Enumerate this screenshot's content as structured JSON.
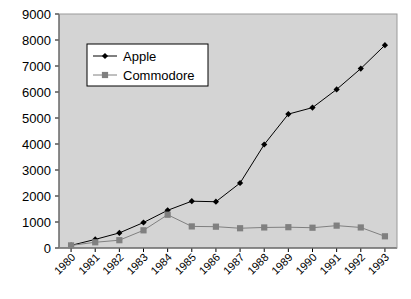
{
  "chart_data": {
    "type": "line",
    "title": "",
    "subtitle": "",
    "xlabel": "",
    "ylabel": "",
    "categories": [
      "1980",
      "1981",
      "1982",
      "1983",
      "1984",
      "1985",
      "1986",
      "1987",
      "1988",
      "1989",
      "1990",
      "1991",
      "1992",
      "1993"
    ],
    "series": [
      {
        "name": "Apple",
        "marker": "diamond",
        "color": "#000000",
        "values": [
          100,
          330,
          580,
          980,
          1450,
          1800,
          1780,
          2500,
          3980,
          5150,
          5400,
          6100,
          6900,
          7800
        ]
      },
      {
        "name": "Commodore",
        "marker": "square",
        "color": "#808080",
        "values": [
          100,
          220,
          300,
          680,
          1280,
          830,
          820,
          760,
          790,
          800,
          780,
          860,
          790,
          450
        ]
      }
    ],
    "ylim": [
      0,
      9000
    ],
    "yticks": [
      0,
      1000,
      2000,
      3000,
      4000,
      5000,
      6000,
      7000,
      8000,
      9000
    ],
    "ytick_labels": [
      "0",
      "1000",
      "2000",
      "3000",
      "4000",
      "5000",
      "6000",
      "7000",
      "8000",
      "9000"
    ],
    "grid": false,
    "legend_position": "top-left-inside",
    "plot_background": "#d4d4d4",
    "figure_background": "#ffffff",
    "legend_background": "#ffffff",
    "axis_color": "#000000"
  },
  "legend": {
    "entries": [
      {
        "label": "Apple"
      },
      {
        "label": "Commodore"
      }
    ]
  }
}
